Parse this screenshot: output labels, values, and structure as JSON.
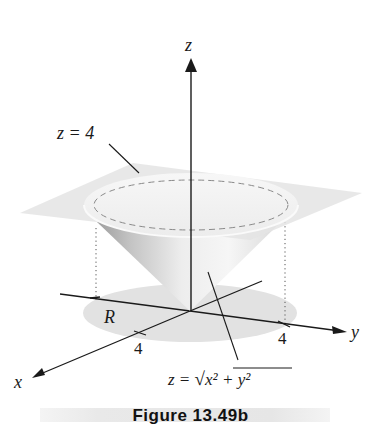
{
  "figure": {
    "axes": {
      "z_label": "z",
      "y_label": "y",
      "x_label": "x",
      "x_tick": "4",
      "y_tick": "4"
    },
    "labels": {
      "plane": "z = 4",
      "region": "R",
      "cone_prefix": "z = ",
      "cone_radicand": "x² + y²"
    },
    "colors": {
      "plane": "#e6e6e6",
      "region": "#e3e3e3",
      "cone_light": "#f2f2f2",
      "cone_dark": "#bdbdbd",
      "lines": "#1a1a1a"
    }
  },
  "caption": {
    "text": "Figure 13.49b"
  }
}
